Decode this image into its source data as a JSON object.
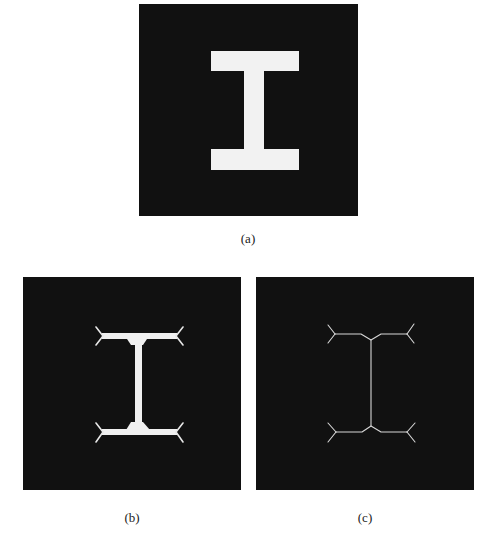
{
  "figure": {
    "panels": [
      {
        "id": "a",
        "caption": "(a)",
        "description": "Original binary image: white I-beam shape on black background",
        "background_color": "#111111",
        "foreground_color": "#f2f2f2"
      },
      {
        "id": "b",
        "caption": "(b)",
        "description": "Partially thinned I shape with forked branches at flange ends",
        "background_color": "#111111",
        "foreground_color": "#f0f0f0"
      },
      {
        "id": "c",
        "caption": "(c)",
        "description": "One-pixel-wide skeleton of the I shape with forked ends",
        "background_color": "#111111",
        "foreground_color": "#d8d8d8"
      }
    ]
  }
}
